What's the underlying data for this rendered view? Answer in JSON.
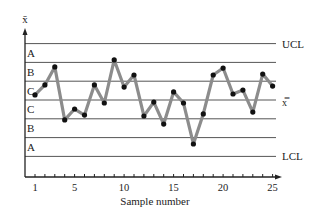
{
  "chart_data": {
    "type": "line",
    "title": "",
    "subtitle": "Control chart with zones A, B, C",
    "xlabel": "Sample number",
    "ylabel": "x̄",
    "x": [
      1,
      2,
      3,
      4,
      5,
      6,
      7,
      8,
      9,
      10,
      11,
      12,
      13,
      14,
      15,
      16,
      17,
      18,
      19,
      20,
      21,
      22,
      23,
      24,
      25
    ],
    "x_ticks": [
      1,
      5,
      10,
      15,
      20,
      25
    ],
    "x_tick_labels": [
      "1",
      "5",
      "10",
      "15",
      "20",
      "25"
    ],
    "units": "sigma from center line",
    "series": [
      {
        "name": "Sample mean",
        "values": [
          0.27,
          0.8,
          1.76,
          -1.06,
          -0.48,
          -0.8,
          0.8,
          -0.16,
          2.13,
          0.69,
          1.33,
          -0.85,
          -0.11,
          -1.28,
          0.43,
          -0.16,
          -2.34,
          -0.74,
          1.33,
          1.7,
          0.32,
          0.53,
          -0.64,
          1.38,
          0.74
        ]
      }
    ],
    "reference_lines": [
      {
        "label": "UCL",
        "value": 3
      },
      {
        "label": "",
        "value": 2
      },
      {
        "label": "",
        "value": 1
      },
      {
        "label": "x̿",
        "value": 0
      },
      {
        "label": "",
        "value": -1
      },
      {
        "label": "",
        "value": -2
      },
      {
        "label": "LCL",
        "value": -3
      }
    ],
    "zones": [
      {
        "label": "A",
        "from": 2,
        "to": 3
      },
      {
        "label": "B",
        "from": 1,
        "to": 2
      },
      {
        "label": "C",
        "from": 0,
        "to": 1
      },
      {
        "label": "C",
        "from": -1,
        "to": 0
      },
      {
        "label": "B",
        "from": -2,
        "to": -1
      },
      {
        "label": "A",
        "from": -3,
        "to": -2
      }
    ],
    "ylim": [
      -4.1,
      3.5
    ],
    "grid": false,
    "legend": "none",
    "colors": {
      "line": "#8c8c8c",
      "marker": "#111111",
      "rule": "#555555",
      "axis": "#222222"
    }
  }
}
